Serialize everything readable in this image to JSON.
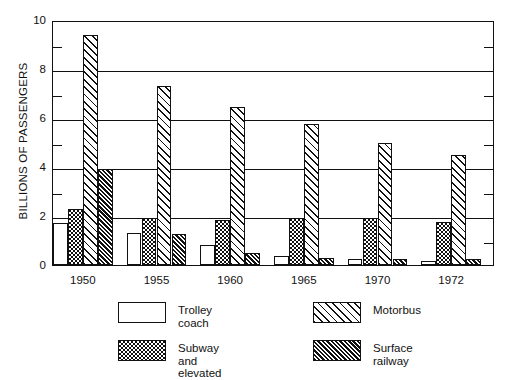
{
  "chart_data": {
    "type": "bar",
    "title": "",
    "xlabel": "",
    "ylabel": "BILLIONS OF PASSENGERS",
    "categories": [
      "1950",
      "1955",
      "1960",
      "1965",
      "1970",
      "1972"
    ],
    "ylim": [
      0,
      10
    ],
    "ytick_labels": [
      "0",
      "2",
      "4",
      "6",
      "8",
      "10"
    ],
    "ytick_values": [
      0,
      2,
      4,
      6,
      8,
      10
    ],
    "yminor_values": [
      1,
      3,
      5,
      7,
      9
    ],
    "grid": true,
    "legend_position": "below",
    "series": [
      {
        "name": "Trolley coach",
        "pattern": "open-white",
        "values": [
          1.7,
          1.3,
          0.8,
          0.35,
          0.25,
          0.15
        ]
      },
      {
        "name": "Subway and\nelevated",
        "pattern": "stipple-dotted",
        "values": [
          2.3,
          1.9,
          1.85,
          1.9,
          1.9,
          1.75
        ]
      },
      {
        "name": "Motorbus",
        "pattern": "diagonal-open-hatch",
        "values": [
          9.4,
          7.3,
          6.45,
          5.75,
          5.0,
          4.5
        ]
      },
      {
        "name": "Surface railway",
        "pattern": "diagonal-dense-hatch",
        "values": [
          3.9,
          1.25,
          0.5,
          0.3,
          0.25,
          0.25
        ]
      }
    ]
  },
  "legend": {
    "items": [
      {
        "label": "Trolley coach",
        "pattern": "open-white"
      },
      {
        "label": "Motorbus",
        "pattern": "diagonal-open-hatch"
      },
      {
        "label": "Subway and\nelevated",
        "pattern": "stipple-dotted"
      },
      {
        "label": "Surface railway",
        "pattern": "diagonal-dense-hatch"
      }
    ]
  },
  "colors": {
    "ink": "#111111",
    "background": "#ffffff"
  }
}
